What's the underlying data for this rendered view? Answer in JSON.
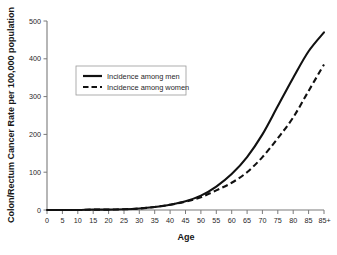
{
  "figure": {
    "background_color": "#ffffff",
    "line_color": "#111111",
    "axis_color": "#7a7a7a"
  },
  "axes": {
    "x_title": "Age",
    "y_title": "Colon/Rectum Cancer Rate per 100,000 population"
  },
  "legend": {
    "items": [
      {
        "label": "Incidence among men",
        "style": "solid"
      },
      {
        "label": "Incidence among women",
        "style": "dashed"
      }
    ]
  },
  "ticks": {
    "x": [
      "0",
      "5",
      "10",
      "15",
      "20",
      "25",
      "30",
      "35",
      "40",
      "45",
      "50",
      "55",
      "60",
      "65",
      "70",
      "75",
      "80",
      "85",
      "85+"
    ],
    "y": [
      "0",
      "100",
      "200",
      "300",
      "400",
      "500"
    ]
  },
  "caption_ghost": "cut-off caption text from source page",
  "chart_data": {
    "type": "line",
    "title": "",
    "subtitle": "",
    "xlabel": "Age",
    "ylabel": "Colon/Rectum Cancer Rate per 100,000 population",
    "xlim": [
      0,
      90
    ],
    "ylim": [
      0,
      500
    ],
    "grid": false,
    "legend_position": "upper-left-inside",
    "x_tick_labels": [
      "0",
      "5",
      "10",
      "15",
      "20",
      "25",
      "30",
      "35",
      "40",
      "45",
      "50",
      "55",
      "60",
      "65",
      "70",
      "75",
      "80",
      "85",
      "85+"
    ],
    "x": [
      0,
      5,
      10,
      15,
      20,
      25,
      30,
      35,
      40,
      45,
      50,
      55,
      60,
      65,
      70,
      75,
      80,
      85,
      90
    ],
    "series": [
      {
        "name": "Incidence among men",
        "style": "solid",
        "values": [
          0,
          0,
          0,
          1,
          1,
          2,
          4,
          8,
          14,
          23,
          38,
          62,
          95,
          140,
          200,
          275,
          350,
          420,
          470
        ]
      },
      {
        "name": "Incidence among women",
        "style": "dashed",
        "values": [
          0,
          0,
          0,
          1,
          1,
          2,
          4,
          8,
          14,
          22,
          34,
          52,
          72,
          100,
          140,
          190,
          245,
          315,
          385
        ]
      }
    ]
  }
}
